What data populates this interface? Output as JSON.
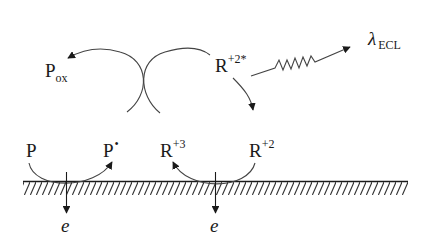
{
  "diagram": {
    "nodes": {
      "P": {
        "base": "P",
        "sup": "",
        "sub": ""
      },
      "P_radical": {
        "base": "P",
        "sup": "•",
        "sub": ""
      },
      "P_ox": {
        "base": "P",
        "sup": "",
        "sub": "ox"
      },
      "R3": {
        "base": "R",
        "sup": "+3",
        "sub": ""
      },
      "R2": {
        "base": "R",
        "sup": "+2",
        "sub": ""
      },
      "R2_excited": {
        "base": "R",
        "sup": "+2*",
        "sub": ""
      },
      "lambda": {
        "base": "λ",
        "sup": "",
        "sub": "ECL"
      }
    },
    "electrons": [
      {
        "label": "e"
      },
      {
        "label": "e"
      }
    ],
    "edges": [
      {
        "from": "P",
        "to": "P•",
        "type": "oxidation arc"
      },
      {
        "from": "P•",
        "to": "Pox",
        "type": "curved arrow"
      },
      {
        "from": "R+3",
        "to": "R+2*",
        "type": "curved arc"
      },
      {
        "from": "R+2*",
        "to": "R+2",
        "type": "curved arrow"
      },
      {
        "from": "R+2",
        "to": "R+3",
        "type": "oxidation arc"
      },
      {
        "from": "R+2*",
        "to": "λECL",
        "type": "wavy emission arrow"
      }
    ],
    "colors": {
      "ink": "#1a1a1a",
      "background": "#ffffff"
    }
  }
}
